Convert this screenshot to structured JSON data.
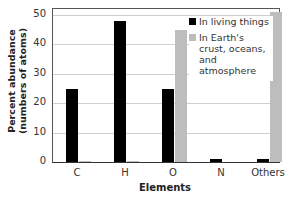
{
  "chart_data": {
    "type": "bar",
    "title": "",
    "xlabel": "Elements",
    "ylabel": "Percent abundance (numbers of atoms)",
    "ylabel_lines": [
      "Percent abundance",
      "(numbers of atoms)"
    ],
    "categories": [
      "C",
      "H",
      "O",
      "N",
      "Others"
    ],
    "series": [
      {
        "name": "In living things",
        "color": "#000000",
        "values": [
          25,
          48,
          25,
          1,
          1
        ]
      },
      {
        "name": "In Earth's crust, oceans, and atmosphere",
        "color": "#bdbdbd",
        "values": [
          0.5,
          0.5,
          45,
          0,
          51
        ]
      }
    ],
    "ylim": [
      0,
      51
    ],
    "yticks": [
      0,
      10,
      20,
      30,
      40,
      50
    ],
    "grid": true,
    "legend_position": "upper right"
  },
  "legend": {
    "living": "In living things",
    "earth": "In Earth's crust, oceans, and atmosphere"
  }
}
